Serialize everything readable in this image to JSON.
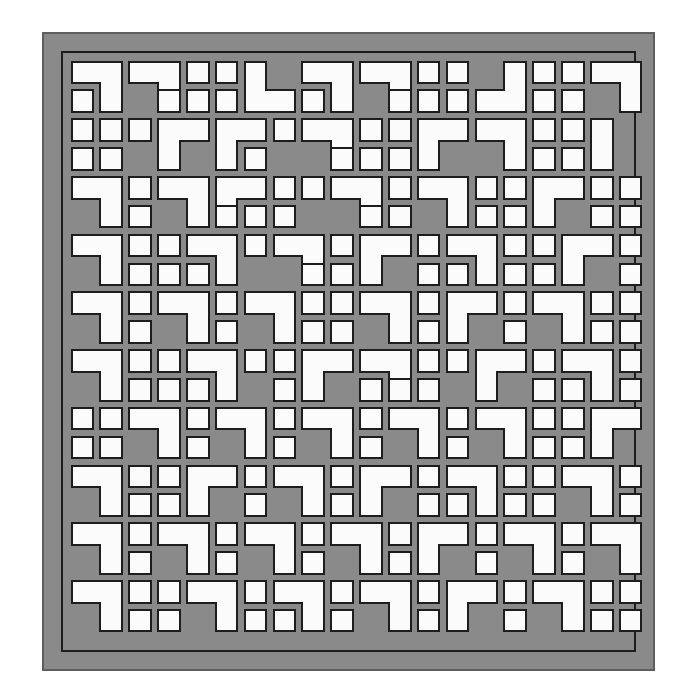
{
  "canvas": {
    "width": 694,
    "height": 699,
    "background": "#ffffff"
  },
  "artwork": {
    "title": "Decorative Lattice Screen Panel",
    "kind": "geometric-grille",
    "description": "Square grille panel: a gray frame enclosing a 20 by 20 grid of white cut-out openings formed from single squares, dominoes and L-shaped trominoes."
  },
  "colors": {
    "frame_fill": "#8a8a8a",
    "field_fill": "#8a8a8a",
    "opening_fill": "#fbfbfb",
    "outline": "#1d1d1d",
    "frame_edge": "#5e5e5e",
    "page_background": "#ffffff"
  },
  "geometry": {
    "frame_x": 43,
    "frame_y": 33,
    "frame_w": 611,
    "frame_h": 637,
    "frame_border_px": 2,
    "inner_rule_inset": 19,
    "inner_rule_px": 2,
    "grid_origin_x": 68,
    "grid_origin_y": 58,
    "grid_cols": 20,
    "grid_rows": 20,
    "cell_pitch": 28.85,
    "opening_size": 21.6,
    "opening_radius": 1.0,
    "outline_px": 2.0
  },
  "pattern": {
    "legend": {
      "0": "solid (no opening)",
      "1": "single square",
      "2": "horizontal domino (2 wide)",
      "3": "vertical domino (2 tall)",
      "4": "L tromino, corner top-left",
      "5": "L tromino, corner top-right",
      "6": "L tromino, corner bottom-right",
      "7": "L tromino, corner bottom-left"
    },
    "shapes": [
      {
        "r": 0,
        "c": 0,
        "t": 5
      },
      {
        "r": 0,
        "c": 2,
        "t": 5
      },
      {
        "r": 0,
        "c": 4,
        "t": 1
      },
      {
        "r": 0,
        "c": 5,
        "t": 1
      },
      {
        "r": 0,
        "c": 6,
        "t": 7
      },
      {
        "r": 0,
        "c": 8,
        "t": 5
      },
      {
        "r": 0,
        "c": 10,
        "t": 5
      },
      {
        "r": 0,
        "c": 12,
        "t": 1
      },
      {
        "r": 0,
        "c": 13,
        "t": 1
      },
      {
        "r": 0,
        "c": 14,
        "t": 6
      },
      {
        "r": 0,
        "c": 16,
        "t": 1
      },
      {
        "r": 0,
        "c": 17,
        "t": 1
      },
      {
        "r": 0,
        "c": 18,
        "t": 5
      },
      {
        "r": 1,
        "c": 0,
        "t": 1
      },
      {
        "r": 1,
        "c": 3,
        "t": 1
      },
      {
        "r": 1,
        "c": 4,
        "t": 1
      },
      {
        "r": 1,
        "c": 5,
        "t": 1
      },
      {
        "r": 1,
        "c": 8,
        "t": 1
      },
      {
        "r": 1,
        "c": 11,
        "t": 1
      },
      {
        "r": 1,
        "c": 12,
        "t": 1
      },
      {
        "r": 1,
        "c": 13,
        "t": 1
      },
      {
        "r": 1,
        "c": 16,
        "t": 1
      },
      {
        "r": 1,
        "c": 17,
        "t": 1
      },
      {
        "r": 2,
        "c": 0,
        "t": 1
      },
      {
        "r": 2,
        "c": 1,
        "t": 1
      },
      {
        "r": 2,
        "c": 2,
        "t": 1
      },
      {
        "r": 2,
        "c": 3,
        "t": 4
      },
      {
        "r": 2,
        "c": 5,
        "t": 4
      },
      {
        "r": 2,
        "c": 7,
        "t": 1
      },
      {
        "r": 2,
        "c": 8,
        "t": 5
      },
      {
        "r": 2,
        "c": 10,
        "t": 1
      },
      {
        "r": 2,
        "c": 11,
        "t": 1
      },
      {
        "r": 2,
        "c": 12,
        "t": 4
      },
      {
        "r": 2,
        "c": 14,
        "t": 5
      },
      {
        "r": 2,
        "c": 16,
        "t": 1
      },
      {
        "r": 2,
        "c": 17,
        "t": 1
      },
      {
        "r": 2,
        "c": 18,
        "t": 3
      },
      {
        "r": 3,
        "c": 0,
        "t": 1
      },
      {
        "r": 3,
        "c": 1,
        "t": 1
      },
      {
        "r": 3,
        "c": 6,
        "t": 1
      },
      {
        "r": 3,
        "c": 9,
        "t": 1
      },
      {
        "r": 3,
        "c": 10,
        "t": 1
      },
      {
        "r": 3,
        "c": 11,
        "t": 1
      },
      {
        "r": 3,
        "c": 16,
        "t": 1
      },
      {
        "r": 3,
        "c": 17,
        "t": 1
      },
      {
        "r": 4,
        "c": 0,
        "t": 5
      },
      {
        "r": 4,
        "c": 2,
        "t": 1
      },
      {
        "r": 4,
        "c": 3,
        "t": 5
      },
      {
        "r": 4,
        "c": 5,
        "t": 4
      },
      {
        "r": 4,
        "c": 7,
        "t": 1
      },
      {
        "r": 4,
        "c": 8,
        "t": 1
      },
      {
        "r": 4,
        "c": 9,
        "t": 5
      },
      {
        "r": 4,
        "c": 11,
        "t": 1
      },
      {
        "r": 4,
        "c": 12,
        "t": 5
      },
      {
        "r": 4,
        "c": 14,
        "t": 1
      },
      {
        "r": 4,
        "c": 15,
        "t": 1
      },
      {
        "r": 4,
        "c": 16,
        "t": 4
      },
      {
        "r": 4,
        "c": 18,
        "t": 1
      },
      {
        "r": 4,
        "c": 19,
        "t": 1
      },
      {
        "r": 5,
        "c": 2,
        "t": 1
      },
      {
        "r": 5,
        "c": 5,
        "t": 1
      },
      {
        "r": 5,
        "c": 6,
        "t": 1
      },
      {
        "r": 5,
        "c": 7,
        "t": 1
      },
      {
        "r": 5,
        "c": 10,
        "t": 1
      },
      {
        "r": 5,
        "c": 11,
        "t": 1
      },
      {
        "r": 5,
        "c": 14,
        "t": 1
      },
      {
        "r": 5,
        "c": 15,
        "t": 1
      },
      {
        "r": 5,
        "c": 18,
        "t": 1
      },
      {
        "r": 5,
        "c": 19,
        "t": 1
      },
      {
        "r": 6,
        "c": 0,
        "t": 5
      },
      {
        "r": 6,
        "c": 2,
        "t": 1
      },
      {
        "r": 6,
        "c": 3,
        "t": 1
      },
      {
        "r": 6,
        "c": 4,
        "t": 5
      },
      {
        "r": 6,
        "c": 6,
        "t": 1
      },
      {
        "r": 6,
        "c": 7,
        "t": 5
      },
      {
        "r": 6,
        "c": 9,
        "t": 1
      },
      {
        "r": 6,
        "c": 10,
        "t": 4
      },
      {
        "r": 6,
        "c": 12,
        "t": 1
      },
      {
        "r": 6,
        "c": 13,
        "t": 5
      },
      {
        "r": 6,
        "c": 15,
        "t": 1
      },
      {
        "r": 6,
        "c": 16,
        "t": 1
      },
      {
        "r": 6,
        "c": 17,
        "t": 4
      },
      {
        "r": 6,
        "c": 19,
        "t": 1
      },
      {
        "r": 7,
        "c": 2,
        "t": 1
      },
      {
        "r": 7,
        "c": 3,
        "t": 1
      },
      {
        "r": 7,
        "c": 4,
        "t": 1
      },
      {
        "r": 7,
        "c": 8,
        "t": 1
      },
      {
        "r": 7,
        "c": 9,
        "t": 1
      },
      {
        "r": 7,
        "c": 12,
        "t": 1
      },
      {
        "r": 7,
        "c": 13,
        "t": 1
      },
      {
        "r": 7,
        "c": 15,
        "t": 1
      },
      {
        "r": 7,
        "c": 16,
        "t": 1
      },
      {
        "r": 7,
        "c": 19,
        "t": 1
      },
      {
        "r": 8,
        "c": 0,
        "t": 5
      },
      {
        "r": 8,
        "c": 2,
        "t": 1
      },
      {
        "r": 8,
        "c": 3,
        "t": 5
      },
      {
        "r": 8,
        "c": 5,
        "t": 1
      },
      {
        "r": 8,
        "c": 6,
        "t": 5
      },
      {
        "r": 8,
        "c": 8,
        "t": 1
      },
      {
        "r": 8,
        "c": 9,
        "t": 1
      },
      {
        "r": 8,
        "c": 10,
        "t": 5
      },
      {
        "r": 8,
        "c": 12,
        "t": 1
      },
      {
        "r": 8,
        "c": 13,
        "t": 4
      },
      {
        "r": 8,
        "c": 15,
        "t": 1
      },
      {
        "r": 8,
        "c": 16,
        "t": 5
      },
      {
        "r": 8,
        "c": 18,
        "t": 1
      },
      {
        "r": 8,
        "c": 19,
        "t": 1
      },
      {
        "r": 9,
        "c": 2,
        "t": 1
      },
      {
        "r": 9,
        "c": 5,
        "t": 1
      },
      {
        "r": 9,
        "c": 8,
        "t": 1
      },
      {
        "r": 9,
        "c": 9,
        "t": 1
      },
      {
        "r": 9,
        "c": 12,
        "t": 1
      },
      {
        "r": 9,
        "c": 15,
        "t": 1
      },
      {
        "r": 9,
        "c": 18,
        "t": 1
      },
      {
        "r": 9,
        "c": 19,
        "t": 1
      },
      {
        "r": 10,
        "c": 0,
        "t": 5
      },
      {
        "r": 10,
        "c": 2,
        "t": 1
      },
      {
        "r": 10,
        "c": 3,
        "t": 1
      },
      {
        "r": 10,
        "c": 4,
        "t": 5
      },
      {
        "r": 10,
        "c": 6,
        "t": 1
      },
      {
        "r": 10,
        "c": 7,
        "t": 1
      },
      {
        "r": 10,
        "c": 8,
        "t": 4
      },
      {
        "r": 10,
        "c": 10,
        "t": 5
      },
      {
        "r": 10,
        "c": 12,
        "t": 1
      },
      {
        "r": 10,
        "c": 13,
        "t": 1
      },
      {
        "r": 10,
        "c": 14,
        "t": 4
      },
      {
        "r": 10,
        "c": 16,
        "t": 1
      },
      {
        "r": 10,
        "c": 17,
        "t": 5
      },
      {
        "r": 10,
        "c": 19,
        "t": 1
      },
      {
        "r": 11,
        "c": 2,
        "t": 1
      },
      {
        "r": 11,
        "c": 3,
        "t": 1
      },
      {
        "r": 11,
        "c": 4,
        "t": 1
      },
      {
        "r": 11,
        "c": 7,
        "t": 1
      },
      {
        "r": 11,
        "c": 10,
        "t": 1
      },
      {
        "r": 11,
        "c": 11,
        "t": 1
      },
      {
        "r": 11,
        "c": 12,
        "t": 1
      },
      {
        "r": 11,
        "c": 16,
        "t": 1
      },
      {
        "r": 11,
        "c": 17,
        "t": 1
      },
      {
        "r": 11,
        "c": 19,
        "t": 1
      },
      {
        "r": 12,
        "c": 0,
        "t": 1
      },
      {
        "r": 12,
        "c": 1,
        "t": 1
      },
      {
        "r": 12,
        "c": 2,
        "t": 5
      },
      {
        "r": 12,
        "c": 4,
        "t": 1
      },
      {
        "r": 12,
        "c": 5,
        "t": 5
      },
      {
        "r": 12,
        "c": 7,
        "t": 1
      },
      {
        "r": 12,
        "c": 8,
        "t": 5
      },
      {
        "r": 12,
        "c": 10,
        "t": 1
      },
      {
        "r": 12,
        "c": 11,
        "t": 5
      },
      {
        "r": 12,
        "c": 13,
        "t": 1
      },
      {
        "r": 12,
        "c": 14,
        "t": 5
      },
      {
        "r": 12,
        "c": 16,
        "t": 1
      },
      {
        "r": 12,
        "c": 17,
        "t": 1
      },
      {
        "r": 12,
        "c": 18,
        "t": 4
      },
      {
        "r": 13,
        "c": 0,
        "t": 1
      },
      {
        "r": 13,
        "c": 1,
        "t": 1
      },
      {
        "r": 13,
        "c": 4,
        "t": 1
      },
      {
        "r": 13,
        "c": 7,
        "t": 1
      },
      {
        "r": 13,
        "c": 10,
        "t": 1
      },
      {
        "r": 13,
        "c": 13,
        "t": 1
      },
      {
        "r": 13,
        "c": 16,
        "t": 1
      },
      {
        "r": 13,
        "c": 17,
        "t": 1
      },
      {
        "r": 14,
        "c": 0,
        "t": 5
      },
      {
        "r": 14,
        "c": 2,
        "t": 1
      },
      {
        "r": 14,
        "c": 3,
        "t": 1
      },
      {
        "r": 14,
        "c": 4,
        "t": 4
      },
      {
        "r": 14,
        "c": 6,
        "t": 1
      },
      {
        "r": 14,
        "c": 7,
        "t": 5
      },
      {
        "r": 14,
        "c": 9,
        "t": 1
      },
      {
        "r": 14,
        "c": 10,
        "t": 4
      },
      {
        "r": 14,
        "c": 12,
        "t": 1
      },
      {
        "r": 14,
        "c": 13,
        "t": 5
      },
      {
        "r": 14,
        "c": 15,
        "t": 1
      },
      {
        "r": 14,
        "c": 16,
        "t": 1
      },
      {
        "r": 14,
        "c": 17,
        "t": 5
      },
      {
        "r": 14,
        "c": 19,
        "t": 1
      },
      {
        "r": 15,
        "c": 2,
        "t": 1
      },
      {
        "r": 15,
        "c": 3,
        "t": 1
      },
      {
        "r": 15,
        "c": 6,
        "t": 1
      },
      {
        "r": 15,
        "c": 9,
        "t": 1
      },
      {
        "r": 15,
        "c": 12,
        "t": 1
      },
      {
        "r": 15,
        "c": 13,
        "t": 1
      },
      {
        "r": 15,
        "c": 15,
        "t": 1
      },
      {
        "r": 15,
        "c": 16,
        "t": 1
      },
      {
        "r": 15,
        "c": 19,
        "t": 1
      },
      {
        "r": 16,
        "c": 0,
        "t": 5
      },
      {
        "r": 16,
        "c": 2,
        "t": 1
      },
      {
        "r": 16,
        "c": 3,
        "t": 5
      },
      {
        "r": 16,
        "c": 5,
        "t": 1
      },
      {
        "r": 16,
        "c": 6,
        "t": 5
      },
      {
        "r": 16,
        "c": 8,
        "t": 1
      },
      {
        "r": 16,
        "c": 9,
        "t": 5
      },
      {
        "r": 16,
        "c": 11,
        "t": 1
      },
      {
        "r": 16,
        "c": 12,
        "t": 4
      },
      {
        "r": 16,
        "c": 14,
        "t": 1
      },
      {
        "r": 16,
        "c": 15,
        "t": 5
      },
      {
        "r": 16,
        "c": 17,
        "t": 1
      },
      {
        "r": 16,
        "c": 18,
        "t": 5
      },
      {
        "r": 17,
        "c": 2,
        "t": 1
      },
      {
        "r": 17,
        "c": 5,
        "t": 1
      },
      {
        "r": 17,
        "c": 8,
        "t": 1
      },
      {
        "r": 17,
        "c": 11,
        "t": 1
      },
      {
        "r": 17,
        "c": 14,
        "t": 1
      },
      {
        "r": 17,
        "c": 17,
        "t": 1
      },
      {
        "r": 18,
        "c": 0,
        "t": 5
      },
      {
        "r": 18,
        "c": 2,
        "t": 1
      },
      {
        "r": 18,
        "c": 3,
        "t": 1
      },
      {
        "r": 18,
        "c": 4,
        "t": 5
      },
      {
        "r": 18,
        "c": 6,
        "t": 1
      },
      {
        "r": 18,
        "c": 7,
        "t": 5
      },
      {
        "r": 18,
        "c": 9,
        "t": 1
      },
      {
        "r": 18,
        "c": 10,
        "t": 5
      },
      {
        "r": 18,
        "c": 12,
        "t": 1
      },
      {
        "r": 18,
        "c": 13,
        "t": 4
      },
      {
        "r": 18,
        "c": 15,
        "t": 1
      },
      {
        "r": 18,
        "c": 16,
        "t": 5
      },
      {
        "r": 18,
        "c": 18,
        "t": 1
      },
      {
        "r": 18,
        "c": 19,
        "t": 1
      },
      {
        "r": 19,
        "c": 2,
        "t": 1
      },
      {
        "r": 19,
        "c": 3,
        "t": 1
      },
      {
        "r": 19,
        "c": 6,
        "t": 1
      },
      {
        "r": 19,
        "c": 7,
        "t": 1
      },
      {
        "r": 19,
        "c": 9,
        "t": 1
      },
      {
        "r": 19,
        "c": 12,
        "t": 1
      },
      {
        "r": 19,
        "c": 15,
        "t": 1
      },
      {
        "r": 19,
        "c": 18,
        "t": 1
      },
      {
        "r": 19,
        "c": 19,
        "t": 1
      }
    ]
  }
}
